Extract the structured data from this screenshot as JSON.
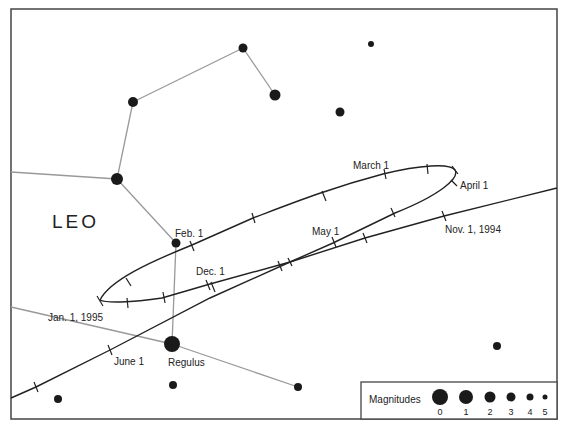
{
  "constellation": {
    "name": "LEO"
  },
  "stars": [
    {
      "name": "",
      "x": 243,
      "y": 48,
      "r": 4.5
    },
    {
      "name": "",
      "x": 275,
      "y": 95,
      "r": 5.5
    },
    {
      "name": "",
      "x": 371,
      "y": 44,
      "r": 3
    },
    {
      "name": "",
      "x": 340,
      "y": 112,
      "r": 4.5
    },
    {
      "name": "",
      "x": 133,
      "y": 102,
      "r": 5
    },
    {
      "name": "",
      "x": 117,
      "y": 179,
      "r": 6
    },
    {
      "name": "",
      "x": 176,
      "y": 243,
      "r": 4.5
    },
    {
      "name": "Regulus",
      "x": 172,
      "y": 344,
      "r": 8
    },
    {
      "name": "",
      "x": 173,
      "y": 385,
      "r": 4
    },
    {
      "name": "",
      "x": 298,
      "y": 387,
      "r": 4
    },
    {
      "name": "",
      "x": 58,
      "y": 399,
      "r": 4
    },
    {
      "name": "",
      "x": 497,
      "y": 346,
      "r": 4
    }
  ],
  "path_labels": {
    "nov1": "Nov. 1, 1994",
    "dec1": "Dec. 1",
    "jan1": "Jan. 1, 1995",
    "feb1": "Feb. 1",
    "mar1": "March 1",
    "apr1": "April 1",
    "may1": "May 1",
    "jun1": "June 1"
  },
  "star_labels": {
    "regulus": "Regulus"
  },
  "legend": {
    "title": "Magnitudes",
    "items": [
      {
        "label": "0",
        "r": 8
      },
      {
        "label": "1",
        "r": 7
      },
      {
        "label": "2",
        "r": 5.5
      },
      {
        "label": "3",
        "r": 4.5
      },
      {
        "label": "4",
        "r": 3.5
      },
      {
        "label": "5",
        "r": 2.5
      }
    ]
  }
}
